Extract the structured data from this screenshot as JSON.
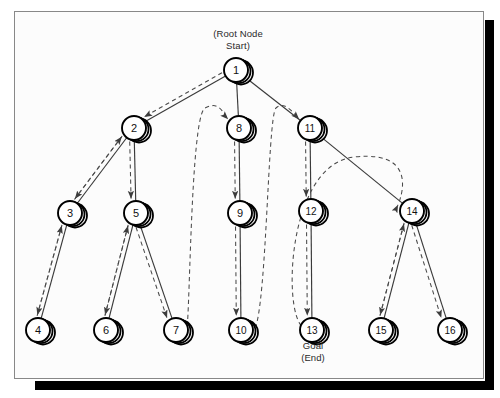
{
  "figure": {
    "type": "search-tree-traversal-diagram",
    "background": "#fcfcfc",
    "frame_color": "#888888",
    "shadow_color": "#000000",
    "node_fill": "#ffffff",
    "node_stroke": "#000000",
    "edge_color": "#3a3a3a",
    "traversal_color": "#4a4a4a"
  },
  "annotations": {
    "root_label": "(Root Node\nStart)",
    "goal_label": "Goal\n(End)"
  },
  "nodes": [
    {
      "id": "1",
      "label": "1",
      "x": 236,
      "y": 70,
      "r": 12
    },
    {
      "id": "2",
      "label": "2",
      "x": 134,
      "y": 128,
      "r": 12
    },
    {
      "id": "3",
      "label": "3",
      "x": 70,
      "y": 213,
      "r": 12
    },
    {
      "id": "4",
      "label": "4",
      "x": 38,
      "y": 330,
      "r": 12
    },
    {
      "id": "5",
      "label": "5",
      "x": 136,
      "y": 213,
      "r": 12
    },
    {
      "id": "6",
      "label": "6",
      "x": 106,
      "y": 330,
      "r": 12
    },
    {
      "id": "7",
      "label": "7",
      "x": 176,
      "y": 330,
      "r": 12
    },
    {
      "id": "8",
      "label": "8",
      "x": 239,
      "y": 128,
      "r": 12
    },
    {
      "id": "9",
      "label": "9",
      "x": 240,
      "y": 213,
      "r": 12
    },
    {
      "id": "10",
      "label": "10",
      "x": 241,
      "y": 330,
      "r": 12
    },
    {
      "id": "11",
      "label": "11",
      "x": 310,
      "y": 128,
      "r": 12
    },
    {
      "id": "12",
      "label": "12",
      "x": 311,
      "y": 211,
      "r": 12
    },
    {
      "id": "13",
      "label": "13",
      "x": 312,
      "y": 330,
      "r": 12
    },
    {
      "id": "14",
      "label": "14",
      "x": 412,
      "y": 211,
      "r": 12
    },
    {
      "id": "15",
      "label": "15",
      "x": 381,
      "y": 330,
      "r": 12
    },
    {
      "id": "16",
      "label": "16",
      "x": 450,
      "y": 330,
      "r": 12
    }
  ],
  "tree_edges": [
    {
      "from": "1",
      "to": "2"
    },
    {
      "from": "1",
      "to": "8"
    },
    {
      "from": "1",
      "to": "11"
    },
    {
      "from": "2",
      "to": "3"
    },
    {
      "from": "2",
      "to": "5"
    },
    {
      "from": "3",
      "to": "4"
    },
    {
      "from": "5",
      "to": "6"
    },
    {
      "from": "5",
      "to": "7"
    },
    {
      "from": "8",
      "to": "9"
    },
    {
      "from": "9",
      "to": "10"
    },
    {
      "from": "11",
      "to": "12"
    },
    {
      "from": "11",
      "to": "14"
    },
    {
      "from": "12",
      "to": "13"
    },
    {
      "from": "14",
      "to": "15"
    },
    {
      "from": "14",
      "to": "16"
    }
  ],
  "traversal_path": [
    {
      "step": 1,
      "from": "1",
      "to": "2",
      "kind": "descend"
    },
    {
      "step": 2,
      "from": "2",
      "to": "3",
      "kind": "descend"
    },
    {
      "step": 3,
      "from": "3",
      "to": "4",
      "kind": "descend"
    },
    {
      "step": 4,
      "from": "4",
      "to": "3",
      "kind": "backtrack"
    },
    {
      "step": 5,
      "from": "3",
      "to": "2",
      "kind": "backtrack"
    },
    {
      "step": 6,
      "from": "2",
      "to": "5",
      "kind": "descend"
    },
    {
      "step": 7,
      "from": "5",
      "to": "6",
      "kind": "descend"
    },
    {
      "step": 8,
      "from": "6",
      "to": "5",
      "kind": "backtrack"
    },
    {
      "step": 9,
      "from": "5",
      "to": "7",
      "kind": "descend"
    },
    {
      "step": 10,
      "from": "7",
      "to": "8",
      "kind": "backtrack-curve"
    },
    {
      "step": 11,
      "from": "8",
      "to": "9",
      "kind": "descend"
    },
    {
      "step": 12,
      "from": "9",
      "to": "10",
      "kind": "descend"
    },
    {
      "step": 13,
      "from": "10",
      "to": "11",
      "kind": "backtrack-curve"
    },
    {
      "step": 14,
      "from": "11",
      "to": "12",
      "kind": "descend"
    },
    {
      "step": 15,
      "from": "12",
      "to": "13",
      "kind": "descend"
    },
    {
      "step": 16,
      "from": "13",
      "to": "14",
      "kind": "backtrack-curve"
    },
    {
      "step": 17,
      "from": "14",
      "to": "15",
      "kind": "descend"
    },
    {
      "step": 18,
      "from": "15",
      "to": "14",
      "kind": "backtrack"
    },
    {
      "step": 19,
      "from": "14",
      "to": "16",
      "kind": "descend"
    }
  ],
  "start_node": "1",
  "goal_node": "13"
}
